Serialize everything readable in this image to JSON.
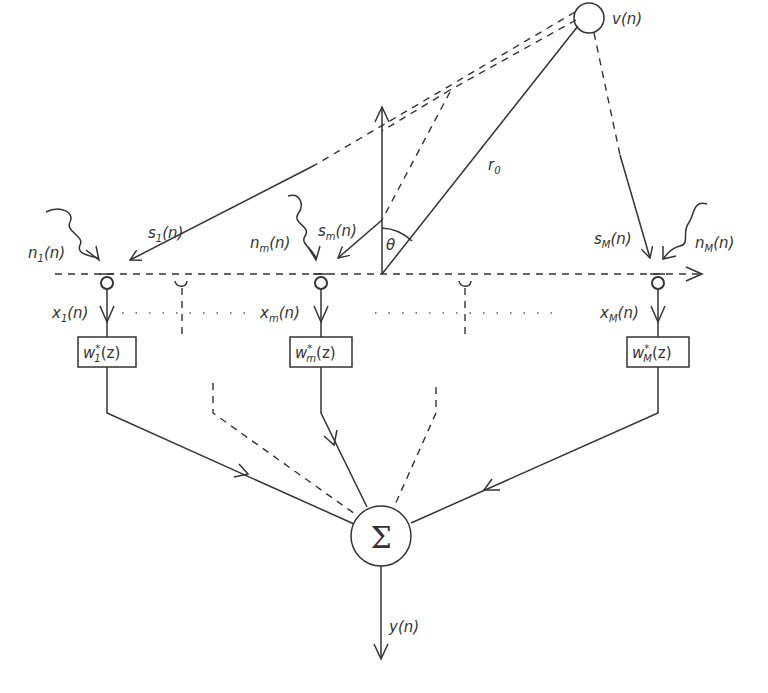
{
  "diagram": {
    "source": {
      "label": "v(n)"
    },
    "range_label": "r",
    "range_sub": "0",
    "angle_label": "θ",
    "sensors": [
      {
        "signal": "s",
        "signal_sub": "1",
        "noise": "n",
        "noise_sub": "1",
        "input": "x",
        "input_sub": "1",
        "weight": "w",
        "weight_sub": "1"
      },
      {
        "signal": "s",
        "signal_sub": "m",
        "noise": "n",
        "noise_sub": "m",
        "input": "x",
        "input_sub": "m",
        "weight": "w",
        "weight_sub": "m"
      },
      {
        "signal": "s",
        "signal_sub": "M",
        "noise": "n",
        "noise_sub": "M",
        "input": "x",
        "input_sub": "M",
        "weight": "w",
        "weight_sub": "M"
      }
    ],
    "arg_n": "(n)",
    "arg_z": "(z)",
    "conj": "*",
    "sum_symbol": "Σ",
    "output": {
      "label": "y(n)"
    }
  }
}
